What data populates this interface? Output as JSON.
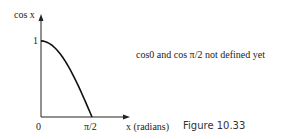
{
  "chart_data": {
    "type": "line",
    "title": "",
    "xlabel": "x (radians)",
    "ylabel": "cos x",
    "x_ticks": [
      "0",
      "π/2"
    ],
    "y_ticks": [
      "1"
    ],
    "series": [
      {
        "name": "cos x",
        "x": [
          0,
          0.1963,
          0.3927,
          0.589,
          0.7854,
          0.9817,
          1.1781,
          1.3744,
          1.5708
        ],
        "values": [
          1,
          0.981,
          0.924,
          0.831,
          0.707,
          0.556,
          0.383,
          0.195,
          0
        ]
      }
    ],
    "xlim": [
      0,
      1.5708
    ],
    "ylim": [
      0,
      1
    ],
    "grid": false,
    "annotations": [
      "cos0 and cos π/2 not defined yet"
    ]
  },
  "labels": {
    "y_axis": "cos x",
    "y_tick_1": "1",
    "x_tick_0": "0",
    "x_tick_pi2": "π/2",
    "x_axis": "x (radians)",
    "note": "cos0 and cos π/2 not defined yet",
    "caption": "Figure 10.33"
  }
}
